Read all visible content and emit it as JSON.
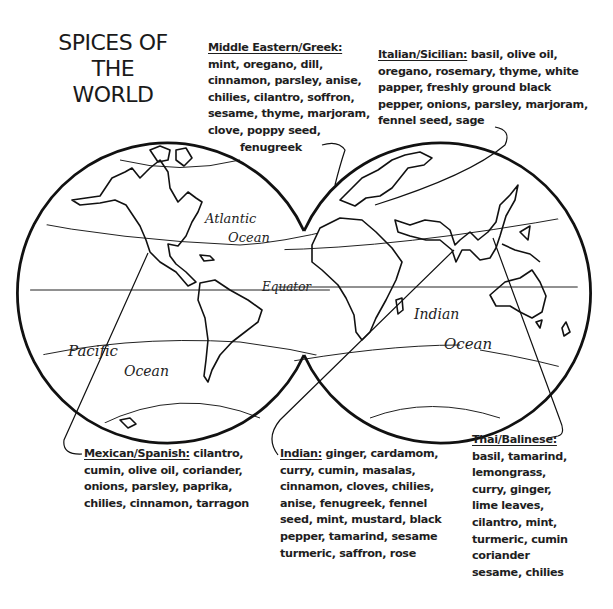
{
  "title": {
    "lines": [
      "SPICES OF",
      "THE",
      "WORLD"
    ]
  },
  "map_labels": {
    "atlantic_1": "Atlantic",
    "atlantic_2": "Ocean",
    "equator": "Equator",
    "pacific_1": "Pacific",
    "pacific_2": "Ocean",
    "indian_1": "Indian",
    "indian_2": "Ocean"
  },
  "cuisines": {
    "middle_eastern": {
      "heading": "Middle Eastern/Greek:",
      "lines": [
        "mint, oregano, dill,",
        "cinnamon, parsley, anise,",
        "chilies, cilantro, soffron,",
        "sesame, thyme, marjoram,",
        "clove, poppy seed,",
        "fenugreek"
      ]
    },
    "italian": {
      "heading": "Italian/Sicilian:",
      "first_line_rest": " basil, olive oil,",
      "lines": [
        "oregano, rosemary, thyme, white",
        "papper, freshly ground black",
        "pepper, onions, parsley, marjoram,",
        "fennel seed, sage"
      ]
    },
    "mexican": {
      "heading": "Mexican/Spanish:",
      "first_line_rest": " cilantro,",
      "lines": [
        "cumin, olive oil, coriander,",
        "onions, parsley, paprika,",
        "chilies, cinnamon, tarragon"
      ]
    },
    "indian": {
      "heading": "Indian:",
      "first_line_rest": " ginger, cardamom,",
      "lines": [
        "curry, cumin, masalas,",
        "cinnamon, cloves, chilies,",
        "anise, fenugreek, fennel",
        "seed, mint, mustard, black",
        "pepper, tamarind, sesame",
        "turmeric, saffron, rose"
      ]
    },
    "thai": {
      "heading": "Thai/Balinese:",
      "lines": [
        "basil, tamarind,",
        "lemongrass,",
        "curry, ginger,",
        "lime leaves,",
        "cilantro, mint,",
        "turmeric, cumin",
        "coriander",
        "sesame, chilies"
      ]
    }
  },
  "colors": {
    "ink": "#1a1a1a",
    "paper": "#ffffff"
  }
}
